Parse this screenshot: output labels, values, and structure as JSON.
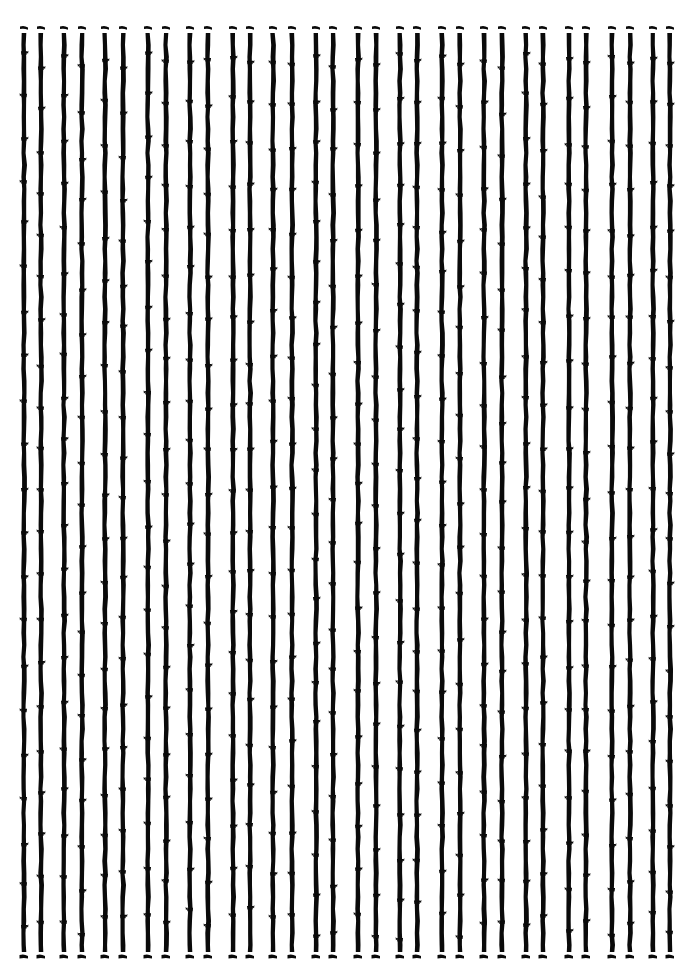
{
  "artwork": {
    "description": "Pattern of vertical bamboo-like stalks arranged in pairs",
    "background_color": "#ffffff",
    "ink_color": "#0a0a0a",
    "stalk_count": 32,
    "pair_count": 16,
    "stalk_width": 4.5,
    "top_cap_y": 28,
    "stalk_top_y": 33,
    "stalk_bottom_y": 952,
    "bottom_cap_y": 957,
    "node_spacing": 43,
    "stalk_x_positions": [
      24,
      41,
      64,
      82,
      105,
      123,
      148,
      166,
      190,
      208,
      233,
      250,
      273,
      292,
      316,
      333,
      358,
      376,
      400,
      417,
      442,
      460,
      484,
      502,
      526,
      543,
      569,
      586,
      612,
      630,
      653,
      670
    ]
  }
}
